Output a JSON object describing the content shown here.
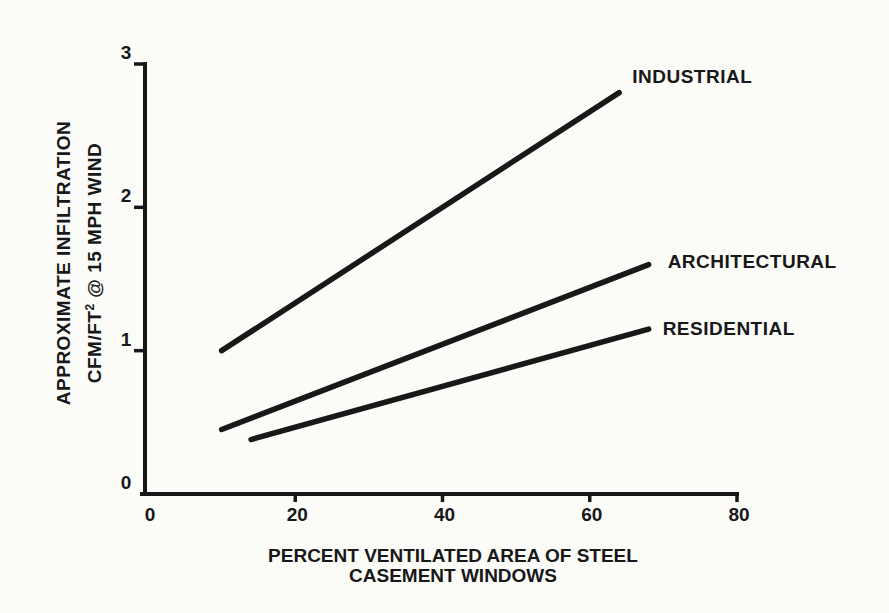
{
  "figure": {
    "background_color": "#fbfbf8",
    "ink_color": "#181818"
  },
  "chart_data": {
    "type": "line",
    "title": "",
    "xlabel_line1": "PERCENT VENTILATED AREA OF STEEL",
    "xlabel_line2": "CASEMENT WINDOWS",
    "ylabel_line1": "APPROXIMATE INFILTRATION",
    "ylabel_line2_prefix": "CFM/FT",
    "ylabel_line2_superscript": "2",
    "ylabel_line2_suffix": " @ 15 MPH WIND",
    "xlim": [
      0,
      80
    ],
    "ylim": [
      0,
      3
    ],
    "xticks": {
      "values": [
        0,
        20,
        40,
        60,
        80
      ],
      "labels": [
        "0",
        "20",
        "40",
        "60",
        "80"
      ]
    },
    "yticks": {
      "values": [
        0,
        1,
        2,
        3
      ],
      "labels": [
        "0",
        "1",
        "2",
        "3"
      ]
    },
    "grid": false,
    "legend_position": "labels-at-line-ends",
    "series": [
      {
        "name": "INDUSTRIAL",
        "points": [
          [
            10,
            1.0
          ],
          [
            64,
            2.8
          ]
        ]
      },
      {
        "name": "ARCHITECTURAL",
        "points": [
          [
            10,
            0.45
          ],
          [
            68,
            1.6
          ]
        ]
      },
      {
        "name": "RESIDENTIAL",
        "points": [
          [
            14,
            0.38
          ],
          [
            68,
            1.15
          ]
        ]
      }
    ]
  }
}
